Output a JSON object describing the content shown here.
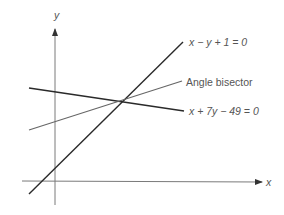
{
  "diagram": {
    "axes": {
      "x_label": "x",
      "y_label": "y"
    },
    "lines": [
      {
        "id": "line-1",
        "equation": "x − y + 1 = 0",
        "color": "#2a2a2a"
      },
      {
        "id": "line-2",
        "equation": "x + 7y − 49 = 0",
        "color": "#2a2a2a"
      },
      {
        "id": "bisector",
        "label": "Angle bisector",
        "color": "#555555"
      }
    ],
    "colors": {
      "axis": "#7a7a7a",
      "text": "#555555"
    }
  }
}
